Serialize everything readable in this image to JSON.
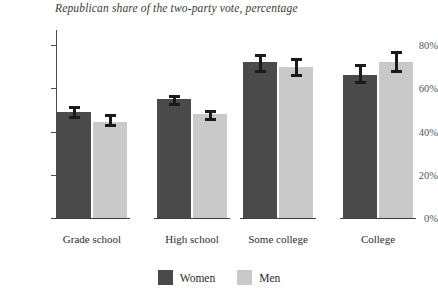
{
  "chart_data": {
    "type": "bar",
    "title": "Republican share of the two-party vote, percentage",
    "subtitle": "",
    "xlabel": "",
    "ylabel": "",
    "categories": [
      "Grade school",
      "High school",
      "Some college",
      "College"
    ],
    "series": [
      {
        "name": "Women",
        "color": "#4a4a4a",
        "values": [
          49,
          55,
          72,
          66
        ],
        "errors_low": [
          46,
          52,
          67,
          62
        ],
        "errors_high": [
          52,
          57,
          76,
          71
        ]
      },
      {
        "name": "Men",
        "color": "#c9c9c9",
        "values": [
          44.5,
          48,
          70,
          72
        ],
        "errors_low": [
          42,
          45,
          65,
          67
        ],
        "errors_high": [
          48,
          50,
          74,
          77
        ]
      }
    ],
    "ylim": [
      0,
      86
    ],
    "yticks": [
      0,
      20,
      40,
      60,
      80
    ],
    "ytick_labels": [
      "0%",
      "20%",
      "40%",
      "60%",
      "80%"
    ],
    "grid": false,
    "legend_position": "bottom",
    "error_bars": true
  },
  "legend": {
    "items": [
      {
        "label": "Women",
        "color": "#4a4a4a"
      },
      {
        "label": "Men",
        "color": "#c9c9c9"
      }
    ]
  },
  "axis": {
    "y_tick_labels": [
      "80%",
      "60%",
      "40%",
      "20%",
      "0%"
    ]
  }
}
